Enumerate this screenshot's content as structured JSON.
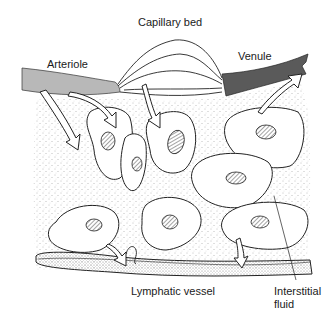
{
  "diagram": {
    "labels": {
      "capillary_bed": "Capillary bed",
      "arteriole": "Arteriole",
      "venule": "Venule",
      "lymphatic_vessel": "Lymphatic vessel",
      "interstitial_fluid_line1": "Interstitial",
      "interstitial_fluid_line2": "fluid"
    },
    "colors": {
      "arteriole": "#b8b8b8",
      "venule": "#5a5a5a",
      "outline": "#222222",
      "stipple": "#8a8a8a",
      "background": "#ffffff"
    }
  }
}
